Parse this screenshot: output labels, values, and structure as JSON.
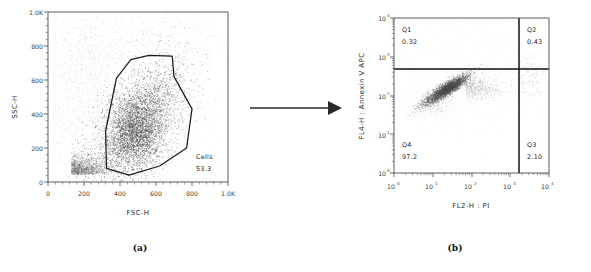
{
  "figure": {
    "arrow_icon": "right-arrow-icon"
  },
  "panel_a": {
    "caption": "(a)",
    "xlabel": "FSC-H",
    "ylabel": "SSC-H",
    "xticks": [
      "0",
      "200",
      "400",
      "600",
      "800",
      "1.0K"
    ],
    "yticks": [
      "0",
      "200",
      "400",
      "600",
      "800",
      "1.0K"
    ],
    "gate_label": "Cells",
    "gate_value": "53.3"
  },
  "panel_b": {
    "caption": "(b)",
    "xlabel": "FL2-H : PI",
    "ylabel": "FL4-H : Annexin V APC",
    "xticks": [
      "10",
      "10",
      "10",
      "10",
      "10"
    ],
    "xtick_exps": [
      "0",
      "1",
      "2",
      "3",
      "4"
    ],
    "yticks": [
      "10",
      "10",
      "10",
      "10",
      "10"
    ],
    "ytick_exps": [
      "0",
      "1",
      "2",
      "3",
      "4"
    ],
    "quadrants": [
      {
        "name": "Q1",
        "value": "0.32"
      },
      {
        "name": "Q2",
        "value": "0.43"
      },
      {
        "name": "Q3",
        "value": "2.10"
      },
      {
        "name": "Q4",
        "value": "97.2"
      }
    ]
  },
  "chart_data": [
    {
      "type": "scatter",
      "id": "panel-a",
      "title": "(a) FSC-H vs SSC-H density dot plot with polygonal cell gate",
      "xlabel": "FSC-H",
      "ylabel": "SSC-H",
      "xlim": [
        0,
        1000
      ],
      "ylim": [
        0,
        1000
      ],
      "xticks": [
        0,
        200,
        400,
        600,
        800,
        1000
      ],
      "xticklabels": [
        "0",
        "200",
        "400",
        "600",
        "800",
        "1.0K"
      ],
      "yticks": [
        0,
        200,
        400,
        600,
        800,
        1000
      ],
      "yticklabels": [
        "0",
        "200",
        "400",
        "600",
        "800",
        "1.0K"
      ],
      "grid": false,
      "legend": "none",
      "scale": "linear",
      "annotations": [
        {
          "text": "Cells",
          "x": 830,
          "y": 150
        },
        {
          "text": "53.3",
          "x": 830,
          "y": 105
        }
      ],
      "gate": {
        "name": "Cells",
        "percent": 53.3,
        "vertices": [
          [
            320,
            300
          ],
          [
            380,
            610
          ],
          [
            460,
            720
          ],
          [
            560,
            745
          ],
          [
            690,
            740
          ],
          [
            700,
            620
          ],
          [
            800,
            430
          ],
          [
            770,
            200
          ],
          [
            620,
            95
          ],
          [
            450,
            40
          ],
          [
            325,
            80
          ]
        ]
      },
      "populations": [
        {
          "name": "gated-cells",
          "center": [
            500,
            330
          ],
          "spread": [
            130,
            190
          ],
          "n": 3300,
          "density": "high"
        },
        {
          "name": "debris",
          "center": [
            120,
            60
          ],
          "spread": [
            70,
            60
          ],
          "n": 900,
          "density": "medium"
        },
        {
          "name": "scatter-background",
          "center": [
            430,
            520
          ],
          "spread": [
            260,
            300
          ],
          "n": 1500,
          "density": "low"
        }
      ]
    },
    {
      "type": "scatter",
      "id": "panel-b",
      "title": "(b) Annexin V APC vs PI quadrant dot plot",
      "xlabel": "FL2-H : PI",
      "ylabel": "FL4-H : Annexin V APC",
      "xlim": [
        1,
        10000
      ],
      "ylim": [
        1,
        10000
      ],
      "scale": "log",
      "xticks": [
        1,
        10,
        100,
        1000,
        10000
      ],
      "xticklabels": [
        "10^0",
        "10^1",
        "10^2",
        "10^3",
        "10^4"
      ],
      "yticks": [
        1,
        10,
        100,
        1000,
        10000
      ],
      "yticklabels": [
        "10^0",
        "10^1",
        "10^2",
        "10^3",
        "10^4"
      ],
      "grid": false,
      "legend": "none",
      "quadrant_divider_x": 1300,
      "quadrant_divider_y": 560,
      "quadrants": [
        {
          "name": "Q1",
          "value": 0.32,
          "position": "top-left"
        },
        {
          "name": "Q2",
          "value": 0.43,
          "position": "top-right"
        },
        {
          "name": "Q3",
          "value": 2.1,
          "position": "bottom-right"
        },
        {
          "name": "Q4",
          "value": 97.2,
          "position": "bottom-left"
        }
      ],
      "populations": [
        {
          "name": "viable-cells",
          "center_log": [
            1.35,
            2.15
          ],
          "spread_log": [
            0.38,
            0.25
          ],
          "n": 2600,
          "density": "high"
        },
        {
          "name": "spillover-tail",
          "center_log": [
            2.0,
            2.25
          ],
          "spread_log": [
            0.35,
            0.2
          ],
          "n": 700,
          "density": "medium"
        },
        {
          "name": "pi-positive",
          "center_log": [
            3.55,
            2.5
          ],
          "spread_log": [
            0.18,
            0.25
          ],
          "n": 120,
          "density": "low"
        }
      ]
    }
  ]
}
